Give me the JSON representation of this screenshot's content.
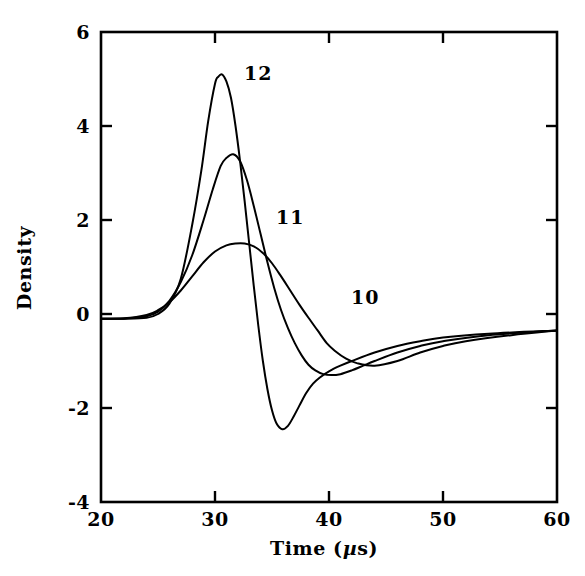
{
  "chart_data": {
    "type": "line",
    "title": "",
    "xlabel": "Time (µs)",
    "ylabel": "Density",
    "xlim": [
      20,
      60
    ],
    "ylim": [
      -4,
      6
    ],
    "xticks": [
      20,
      30,
      40,
      50,
      60
    ],
    "yticks": [
      -4,
      -2,
      0,
      2,
      4,
      6
    ],
    "xtick_labels": [
      "20",
      "30",
      "40",
      "50",
      "60"
    ],
    "ytick_labels": [
      "-4",
      "-2",
      "0",
      "2",
      "4",
      "6"
    ],
    "grid": false,
    "legend": "inline-curve-labels",
    "frame": "box",
    "series": [
      {
        "name": "12",
        "label": "12",
        "label_position": {
          "x": 32.3,
          "y": 5.05
        },
        "peak": {
          "x": 30.6,
          "y": 5.1
        },
        "trough": {
          "x": 35.9,
          "y": -2.45
        },
        "x": [
          20,
          22,
          24,
          25,
          26,
          27,
          28,
          28.8,
          29.4,
          30,
          30.3,
          30.6,
          31,
          31.4,
          31.8,
          32.2,
          32.6,
          33,
          33.4,
          33.8,
          34.2,
          34.6,
          35,
          35.4,
          35.9,
          36.4,
          36.9,
          37.4,
          38,
          38.6,
          39.2,
          40,
          41,
          42,
          44,
          46,
          48,
          50,
          54,
          60
        ],
        "y": [
          -0.1,
          -0.1,
          -0.08,
          0.0,
          0.22,
          0.75,
          1.9,
          3.05,
          4.1,
          4.9,
          5.05,
          5.1,
          4.95,
          4.6,
          4.0,
          3.25,
          2.4,
          1.5,
          0.6,
          -0.25,
          -1.0,
          -1.6,
          -2.05,
          -2.33,
          -2.45,
          -2.38,
          -2.18,
          -1.95,
          -1.68,
          -1.48,
          -1.35,
          -1.22,
          -1.1,
          -1.0,
          -0.82,
          -0.68,
          -0.58,
          -0.5,
          -0.42,
          -0.35
        ]
      },
      {
        "name": "11",
        "label": "11",
        "label_position": {
          "x": 35.2,
          "y": 2.1
        },
        "peak": {
          "x": 31.6,
          "y": 3.4
        },
        "trough": {
          "x": 37.9,
          "y": -1.3
        },
        "x": [
          20,
          22,
          24,
          25,
          26,
          27,
          28,
          29,
          29.8,
          30.5,
          31,
          31.6,
          32.2,
          32.8,
          33.4,
          34,
          34.6,
          35.2,
          35.8,
          36.4,
          37,
          37.6,
          38.2,
          38.8,
          39.5,
          40.2,
          41,
          42,
          43,
          44,
          46,
          48,
          50,
          54,
          60
        ],
        "y": [
          -0.1,
          -0.1,
          -0.05,
          0.05,
          0.28,
          0.68,
          1.25,
          2.0,
          2.65,
          3.15,
          3.32,
          3.4,
          3.25,
          2.85,
          2.3,
          1.7,
          1.1,
          0.55,
          0.08,
          -0.3,
          -0.62,
          -0.88,
          -1.08,
          -1.2,
          -1.28,
          -1.3,
          -1.28,
          -1.2,
          -1.1,
          -1.0,
          -0.82,
          -0.68,
          -0.58,
          -0.45,
          -0.35
        ]
      },
      {
        "name": "10",
        "label": "10",
        "label_position": {
          "x": 42.2,
          "y": 0.62
        },
        "peak": {
          "x": 32.6,
          "y": 1.5
        },
        "trough": {
          "x": 40.5,
          "y": -1.18
        },
        "x": [
          20,
          22,
          24,
          25,
          26,
          27,
          28,
          29,
          30,
          31,
          31.8,
          32.6,
          33.4,
          34.2,
          35,
          35.8,
          36.6,
          37.4,
          38.2,
          39,
          39.8,
          40.5,
          41.5,
          42.5,
          44,
          46,
          48,
          50,
          52,
          56,
          60
        ],
        "y": [
          -0.1,
          -0.09,
          -0.02,
          0.08,
          0.25,
          0.5,
          0.8,
          1.1,
          1.33,
          1.46,
          1.5,
          1.5,
          1.44,
          1.3,
          1.08,
          0.8,
          0.5,
          0.2,
          -0.08,
          -0.35,
          -0.62,
          -0.78,
          -0.95,
          -1.05,
          -1.1,
          -1.0,
          -0.82,
          -0.68,
          -0.58,
          -0.45,
          -0.35
        ]
      }
    ]
  },
  "axes": {
    "y_label_text": "Density",
    "x_label_prefix": "Time (",
    "x_label_mu": "µ",
    "x_label_suffix": "s)"
  }
}
